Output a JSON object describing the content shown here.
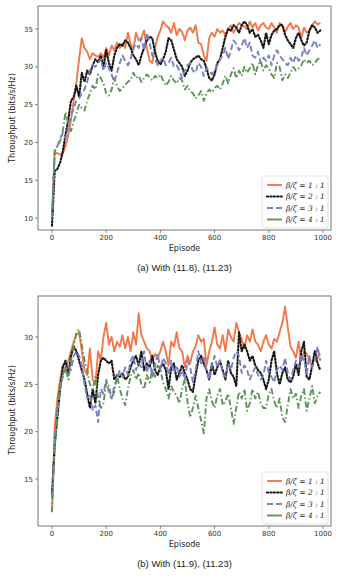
{
  "chart_data": [
    {
      "type": "line",
      "title": "",
      "caption": "(a) With (11.8), (11.23)",
      "xlabel": "Episode",
      "ylabel": "Throughput (bits/s/Hz)",
      "xlim": [
        -50,
        1030
      ],
      "ylim": [
        7.5,
        38
      ],
      "xticks": [
        0,
        200,
        400,
        600,
        800,
        1000
      ],
      "yticks": [
        10,
        15,
        20,
        25,
        30,
        35
      ],
      "grid": false,
      "legend_position": "lower right",
      "x": [
        0,
        10,
        20,
        30,
        40,
        50,
        60,
        70,
        80,
        90,
        100,
        110,
        120,
        130,
        140,
        150,
        160,
        170,
        180,
        190,
        200,
        210,
        220,
        230,
        240,
        250,
        260,
        270,
        280,
        290,
        300,
        310,
        320,
        330,
        340,
        350,
        360,
        370,
        380,
        390,
        400,
        410,
        420,
        430,
        440,
        450,
        460,
        470,
        480,
        490,
        500,
        510,
        520,
        530,
        540,
        550,
        560,
        570,
        580,
        590,
        600,
        610,
        620,
        630,
        640,
        650,
        660,
        670,
        680,
        690,
        700,
        710,
        720,
        730,
        740,
        750,
        760,
        770,
        780,
        790,
        800,
        810,
        820,
        830,
        840,
        850,
        860,
        870,
        880,
        890,
        900,
        910,
        920,
        930,
        940,
        950,
        960,
        970,
        980,
        990
      ],
      "series": [
        {
          "name": "β/ζ = 1 : 1",
          "label_lhs": "β/ζ",
          "label_rhs": "= 1 : 1",
          "style": "solid",
          "color": "#f2784b",
          "values": [
            10,
            18.5,
            18.6,
            18.4,
            18.5,
            19.5,
            21,
            23,
            25.5,
            28,
            31,
            33.8,
            32.5,
            32,
            31,
            31.8,
            31.5,
            31.3,
            31.8,
            31.2,
            32.5,
            31.5,
            32.8,
            32.2,
            33.2,
            32.5,
            33,
            32.5,
            34.5,
            33,
            32.2,
            34.5,
            33.5,
            33.8,
            34.8,
            32.5,
            30.8,
            30.5,
            32.5,
            34,
            34.8,
            36,
            35.5,
            35.2,
            34.5,
            35.8,
            34.2,
            35,
            34.6,
            33.5,
            34.8,
            35.2,
            34.5,
            35.5,
            33.2,
            33,
            31.5,
            30.8,
            33.8,
            34.5,
            34,
            35,
            34.5,
            34.8,
            34.2,
            35,
            35.5,
            34.5,
            35.2,
            35.8,
            35.5,
            35.3,
            35,
            36,
            35.2,
            35.8,
            34.8,
            35.5,
            35.8,
            35.2,
            35,
            35.8,
            35.2,
            34.5,
            35.8,
            35.5,
            34.6,
            35.3,
            35.8,
            35,
            35.5,
            35.2,
            33.8,
            35.2,
            34.5,
            34.8,
            35.5,
            36,
            35.6,
            35.8
          ]
        },
        {
          "name": "β/ζ = 2 : 1",
          "label_lhs": "β/ζ",
          "label_rhs": "= 2 : 1",
          "style": "dotted",
          "color": "#1a1a1a",
          "values": [
            9,
            16.2,
            16.5,
            17.3,
            18.8,
            21,
            23,
            25.5,
            26,
            27.5,
            26,
            29.2,
            28,
            29.5,
            29,
            30.2,
            31,
            30.6,
            31.5,
            30,
            32.2,
            30.5,
            29.5,
            31.5,
            32.5,
            33,
            32.8,
            33.5,
            33.2,
            32.5,
            31.5,
            31,
            30.2,
            31.5,
            32.5,
            33.5,
            34,
            33.8,
            32,
            30.8,
            30.3,
            31,
            32,
            33.8,
            33.5,
            32.3,
            31,
            30.5,
            30,
            28.8,
            29.5,
            30.5,
            31,
            31.2,
            31.5,
            31,
            30.8,
            29.8,
            28.5,
            28.2,
            29,
            30.5,
            31,
            32.5,
            34,
            35,
            34.8,
            35.5,
            35.2,
            34.5,
            35.5,
            36,
            35.5,
            34.5,
            35,
            34,
            34.2,
            33.5,
            32.5,
            34.5,
            33,
            34.2,
            34.8,
            35,
            35.5,
            35.5,
            34.2,
            33.5,
            33,
            32.5,
            33.8,
            34.5,
            33.5,
            32.8,
            33.2,
            34.8,
            35.5,
            35.2,
            34.5,
            34.8
          ]
        },
        {
          "name": "β/ζ = 3 : 1",
          "label_lhs": "β/ζ",
          "label_rhs": "= 3 : 1",
          "style": "dashed",
          "color": "#7b7fc4",
          "values": [
            10,
            18.8,
            19.5,
            20.5,
            21.2,
            20.5,
            22,
            23.5,
            24.5,
            25.5,
            25.8,
            26.5,
            27,
            28,
            29.5,
            30.2,
            30,
            30.5,
            31,
            29.5,
            30.5,
            29.8,
            29,
            28,
            29.2,
            30.5,
            31.5,
            30.8,
            30.2,
            31,
            32.5,
            33,
            32.5,
            33.8,
            32.2,
            34.5,
            33.2,
            31.5,
            31,
            30.2,
            30.8,
            31.2,
            30.2,
            30.5,
            31.2,
            30,
            30.2,
            29.5,
            28.5,
            29.5,
            30.2,
            30.5,
            29.5,
            29.2,
            30.5,
            30,
            28.8,
            29.8,
            29.5,
            29,
            29.5,
            30.2,
            31,
            31.5,
            32.5,
            31,
            32.2,
            33.5,
            33,
            32.2,
            32.8,
            33.8,
            32.5,
            33.2,
            31.5,
            31.2,
            32,
            30.5,
            31.2,
            30.8,
            31.5,
            30.2,
            31.5,
            32.2,
            31.5,
            31,
            30.5,
            30.2,
            31.2,
            30.5,
            31.5,
            30.8,
            31.2,
            32.5,
            31.5,
            32.2,
            32.8,
            33.5,
            32.5,
            33
          ]
        },
        {
          "name": "β/ζ = 4 : 1",
          "label_lhs": "β/ζ",
          "label_rhs": "= 4 : 1",
          "style": "dashdot",
          "color": "#5e9459",
          "values": [
            10,
            19,
            19.5,
            20.2,
            21.5,
            24,
            22.5,
            21.5,
            22.8,
            23.8,
            25,
            24.5,
            24.2,
            25.5,
            26.5,
            27.5,
            27,
            29,
            28.5,
            27.8,
            26.5,
            26.2,
            27,
            28.5,
            27.5,
            26.8,
            27.2,
            27.6,
            28,
            28.3,
            29.2,
            28.5,
            28.8,
            28,
            28.5,
            29,
            28.6,
            28.2,
            28.8,
            28.5,
            29,
            28.2,
            27.5,
            28,
            28.8,
            28.2,
            27.8,
            28.5,
            28.2,
            27,
            27.5,
            26.8,
            26.5,
            25.8,
            26.2,
            26.8,
            25.5,
            26.5,
            27,
            26.6,
            27.2,
            27.5,
            27,
            27.8,
            28.8,
            27.8,
            29,
            29.8,
            28.5,
            29.5,
            28.8,
            30,
            29.2,
            29.8,
            30.5,
            29,
            30.2,
            30.8,
            29.5,
            30.2,
            29.8,
            29,
            28.5,
            30.5,
            30,
            28.2,
            29,
            28.5,
            29.2,
            30,
            29.5,
            29.8,
            30.2,
            31,
            30.5,
            30.8,
            30.2,
            30.5,
            31,
            31.2
          ]
        }
      ]
    },
    {
      "type": "line",
      "title": "",
      "caption": "(b) With (11.9), (11.23)",
      "xlabel": "Episode",
      "ylabel": "Throughput (bits/s/Hz)",
      "xlim": [
        -50,
        1030
      ],
      "ylim": [
        10.4,
        34.6
      ],
      "xticks": [
        0,
        200,
        400,
        600,
        800,
        1000
      ],
      "yticks": [
        15,
        20,
        25,
        30
      ],
      "grid": false,
      "legend_position": "lower right",
      "x": [
        0,
        10,
        20,
        30,
        40,
        50,
        60,
        70,
        80,
        90,
        100,
        110,
        120,
        130,
        140,
        150,
        160,
        170,
        180,
        190,
        200,
        210,
        220,
        230,
        240,
        250,
        260,
        270,
        280,
        290,
        300,
        310,
        320,
        330,
        340,
        350,
        360,
        370,
        380,
        390,
        400,
        410,
        420,
        430,
        440,
        450,
        460,
        470,
        480,
        490,
        500,
        510,
        520,
        530,
        540,
        550,
        560,
        570,
        580,
        590,
        600,
        610,
        620,
        630,
        640,
        650,
        660,
        670,
        680,
        690,
        700,
        710,
        720,
        730,
        740,
        750,
        760,
        770,
        780,
        790,
        800,
        810,
        820,
        830,
        840,
        850,
        860,
        870,
        880,
        890,
        900,
        910,
        920,
        930,
        940,
        950,
        960,
        970,
        980,
        990
      ],
      "series": [
        {
          "name": "β/ζ = 1 : 1",
          "label_lhs": "β/ζ",
          "label_rhs": "= 1 : 1",
          "style": "solid",
          "color": "#f2784b",
          "values": [
            11.5,
            20.5,
            23.5,
            25.5,
            27,
            26.5,
            27.5,
            28.5,
            29.5,
            30.2,
            30.5,
            28.5,
            26.5,
            26,
            28.8,
            25.5,
            25,
            28.5,
            27.5,
            30,
            31.5,
            29.2,
            30,
            28.5,
            29.5,
            29,
            30.2,
            28.8,
            30,
            28.5,
            30.5,
            29.2,
            32.5,
            30.2,
            29.5,
            28.8,
            28.5,
            27.5,
            28.2,
            27.8,
            28.5,
            29.5,
            28.5,
            27,
            29.5,
            29,
            30.5,
            28.8,
            28.5,
            26.8,
            28,
            27.2,
            28.5,
            29,
            30.2,
            29.5,
            29.8,
            27,
            28.5,
            29.5,
            31,
            29.2,
            28.8,
            30.2,
            28.5,
            30.8,
            30,
            29.5,
            31.5,
            30.5,
            29.8,
            28.8,
            30.2,
            29.5,
            30.8,
            29.5,
            29.2,
            28.5,
            29.5,
            30.2,
            29.2,
            28.8,
            29.8,
            29.5,
            30.5,
            31.5,
            33.2,
            31,
            29,
            28.5,
            27.8,
            29.5,
            27.5,
            28.5,
            28.2,
            27.5,
            26.8,
            28.5,
            27.8,
            28.2
          ]
        },
        {
          "name": "β/ζ = 2 : 1",
          "label_lhs": "β/ζ",
          "label_rhs": "= 2 : 1",
          "style": "dotted",
          "color": "#1a1a1a",
          "values": [
            13.5,
            18.5,
            21.5,
            24.5,
            26.8,
            27.5,
            26,
            28,
            29,
            28.5,
            27.5,
            26.5,
            25.5,
            24,
            22.5,
            24.5,
            23,
            26,
            27.5,
            27.8,
            27.5,
            27.2,
            27.5,
            25.5,
            26,
            25.8,
            26.2,
            25.5,
            25.8,
            26.8,
            27.5,
            28,
            27,
            28.5,
            26.5,
            27.2,
            26.8,
            28,
            26.5,
            26,
            26.8,
            27.2,
            26.5,
            24.5,
            26.8,
            27.2,
            25.5,
            26.2,
            27,
            26.2,
            25.5,
            24.5,
            24.2,
            26,
            27.5,
            28,
            27.2,
            26.5,
            25.5,
            27.2,
            26,
            26.8,
            27.5,
            26.5,
            25.5,
            27.5,
            26.2,
            25.8,
            24.8,
            30.5,
            28.5,
            29.2,
            28.5,
            27.5,
            28,
            27,
            26.5,
            26.2,
            25.5,
            24.5,
            25.5,
            27.5,
            28.5,
            26.2,
            25,
            26.2,
            26.8,
            25.5,
            25.2,
            25.8,
            27.2,
            26,
            28.5,
            29.5,
            25.8,
            25.5,
            27,
            28.5,
            27.2,
            26.5
          ]
        },
        {
          "name": "β/ζ = 3 : 1",
          "label_lhs": "β/ζ",
          "label_rhs": "= 3 : 1",
          "style": "dashed",
          "color": "#7b7fc4",
          "values": [
            13,
            18.5,
            22,
            24.5,
            25.8,
            26.5,
            27,
            26.5,
            28,
            28.5,
            28,
            27,
            25,
            23.5,
            24,
            22.2,
            22.8,
            21,
            24.5,
            24,
            25.5,
            24.2,
            23.5,
            24.8,
            25.5,
            26.5,
            25.8,
            26.8,
            26,
            27.5,
            28,
            26.5,
            27.2,
            26.8,
            28.5,
            26.2,
            27.5,
            25.8,
            27,
            28.2,
            26.5,
            27.8,
            27.2,
            26,
            27.5,
            26.2,
            27,
            25.8,
            26.5,
            25.5,
            27.5,
            26.8,
            25.2,
            26.5,
            28.5,
            27.2,
            27.8,
            26.5,
            25.5,
            27,
            28,
            26.8,
            27.5,
            26.2,
            25.8,
            27.2,
            26.5,
            27.8,
            28.5,
            28,
            26.2,
            27,
            26.5,
            25.5,
            26.2,
            26.8,
            26,
            25.5,
            26,
            27.5,
            26.2,
            25.8,
            25.2,
            26.5,
            27,
            26.5,
            27.8,
            26.2,
            25.5,
            26.5,
            27.5,
            26.8,
            28.2,
            27.5,
            26.2,
            28,
            26.8,
            27.5,
            29,
            27.5
          ]
        },
        {
          "name": "β/ζ = 4 : 1",
          "label_lhs": "β/ζ",
          "label_rhs": "= 4 : 1",
          "style": "dashdot",
          "color": "#5e9459",
          "values": [
            11.5,
            19,
            22.5,
            24.8,
            26,
            26.8,
            25.5,
            27.5,
            29,
            30.5,
            30.8,
            29.2,
            27.5,
            26.5,
            25,
            24.5,
            25.8,
            23.5,
            22.5,
            23,
            25.2,
            24.8,
            23.5,
            24.2,
            26,
            24.5,
            23.5,
            22.8,
            24.5,
            25.8,
            26.5,
            25.5,
            26.2,
            25,
            24.5,
            26,
            25.2,
            26.5,
            25.8,
            27,
            26.5,
            25.2,
            24.5,
            23.5,
            24.8,
            24.2,
            23.8,
            23,
            24.5,
            25.5,
            23.2,
            21.5,
            22.5,
            23.8,
            22.5,
            21.2,
            19.8,
            23.5,
            24.5,
            23.2,
            22.5,
            23.8,
            24.5,
            22.8,
            23.2,
            24,
            22.5,
            20.8,
            22.5,
            24.2,
            23.5,
            24.5,
            22.2,
            23,
            24.5,
            23.5,
            24.2,
            23,
            22.5,
            22.5,
            24,
            24.5,
            23.2,
            22.5,
            23.5,
            21.5,
            21,
            22.8,
            24.5,
            23.5,
            24,
            22.5,
            23.8,
            24.5,
            22.2,
            23.5,
            24.8,
            23,
            23.8,
            24.2
          ]
        }
      ]
    }
  ]
}
